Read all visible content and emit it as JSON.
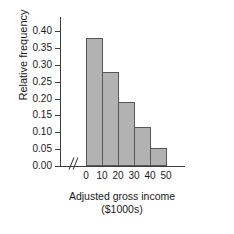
{
  "chart_data": {
    "type": "bar",
    "title": "",
    "subtitle": "",
    "xlabel": "Adjusted gross income",
    "xlabel_units": "($1000s)",
    "ylabel": "Relative frequency",
    "categories": [
      "0-10",
      "10-20",
      "20-30",
      "30-40",
      "40-50"
    ],
    "bin_edges": [
      0,
      10,
      20,
      30,
      40,
      50
    ],
    "values": [
      0.38,
      0.28,
      0.19,
      0.115,
      0.052
    ],
    "xlim": [
      0,
      50
    ],
    "ylim": [
      0.0,
      0.4
    ],
    "x_ticks": [
      "0",
      "10",
      "20",
      "30",
      "40",
      "50"
    ],
    "x_tick_values": [
      0,
      10,
      20,
      30,
      40,
      50
    ],
    "y_ticks": [
      "0.00",
      "0.05",
      "0.10",
      "0.15",
      "0.20",
      "0.25",
      "0.30",
      "0.35",
      "0.40"
    ],
    "y_tick_values": [
      0.0,
      0.05,
      0.1,
      0.15,
      0.2,
      0.25,
      0.3,
      0.35,
      0.4
    ],
    "grid": false,
    "legend": false,
    "axis_break": "//",
    "bar_fill_color": "#b2b2b2",
    "bar_edge_color": "#585858",
    "axis_color": "#3d3d3d",
    "background_color": "#ffffff",
    "text_color": "#1a1a1a"
  }
}
